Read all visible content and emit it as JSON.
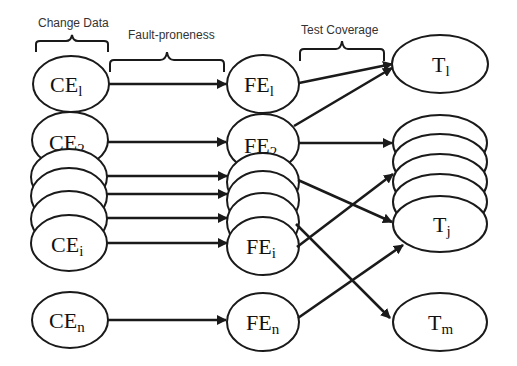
{
  "labels": {
    "change_data": "Change Data",
    "fault_proneness": "Fault-proneness",
    "test_coverage": "Test Coverage"
  },
  "nodes": {
    "ce1": {
      "base": "CE",
      "sub": "l"
    },
    "ce2": {
      "base": "CE",
      "sub": "2"
    },
    "cei": {
      "base": "CE",
      "sub": "i"
    },
    "cen": {
      "base": "CE",
      "sub": "n"
    },
    "fe1": {
      "base": "FE",
      "sub": "l"
    },
    "fe2": {
      "base": "FE",
      "sub": "2"
    },
    "fei": {
      "base": "FE",
      "sub": "i"
    },
    "fen": {
      "base": "FE",
      "sub": "n"
    },
    "t1": {
      "base": "T",
      "sub": "l"
    },
    "tj": {
      "base": "T",
      "sub": "j"
    },
    "tm": {
      "base": "T",
      "sub": "m"
    }
  },
  "edges": [
    {
      "from": "CE1",
      "to": "FE1"
    },
    {
      "from": "CE2",
      "to": "FE2"
    },
    {
      "from": "CE-stack-3",
      "to": "FE-stack-3"
    },
    {
      "from": "CE-stack-4",
      "to": "FE-stack-4"
    },
    {
      "from": "CE-stack-5",
      "to": "FE-stack-5"
    },
    {
      "from": "CEi",
      "to": "FEi"
    },
    {
      "from": "CEn",
      "to": "FEn"
    },
    {
      "from": "FE1",
      "to": "T1"
    },
    {
      "from": "FE2",
      "to": "T1"
    },
    {
      "from": "FE2",
      "to": "T-stack-top"
    },
    {
      "from": "FE-stack",
      "to": "Tj"
    },
    {
      "from": "FE-stack",
      "to": "Tm"
    },
    {
      "from": "FEi",
      "to": "T-stack"
    },
    {
      "from": "FEn",
      "to": "Tj"
    }
  ]
}
